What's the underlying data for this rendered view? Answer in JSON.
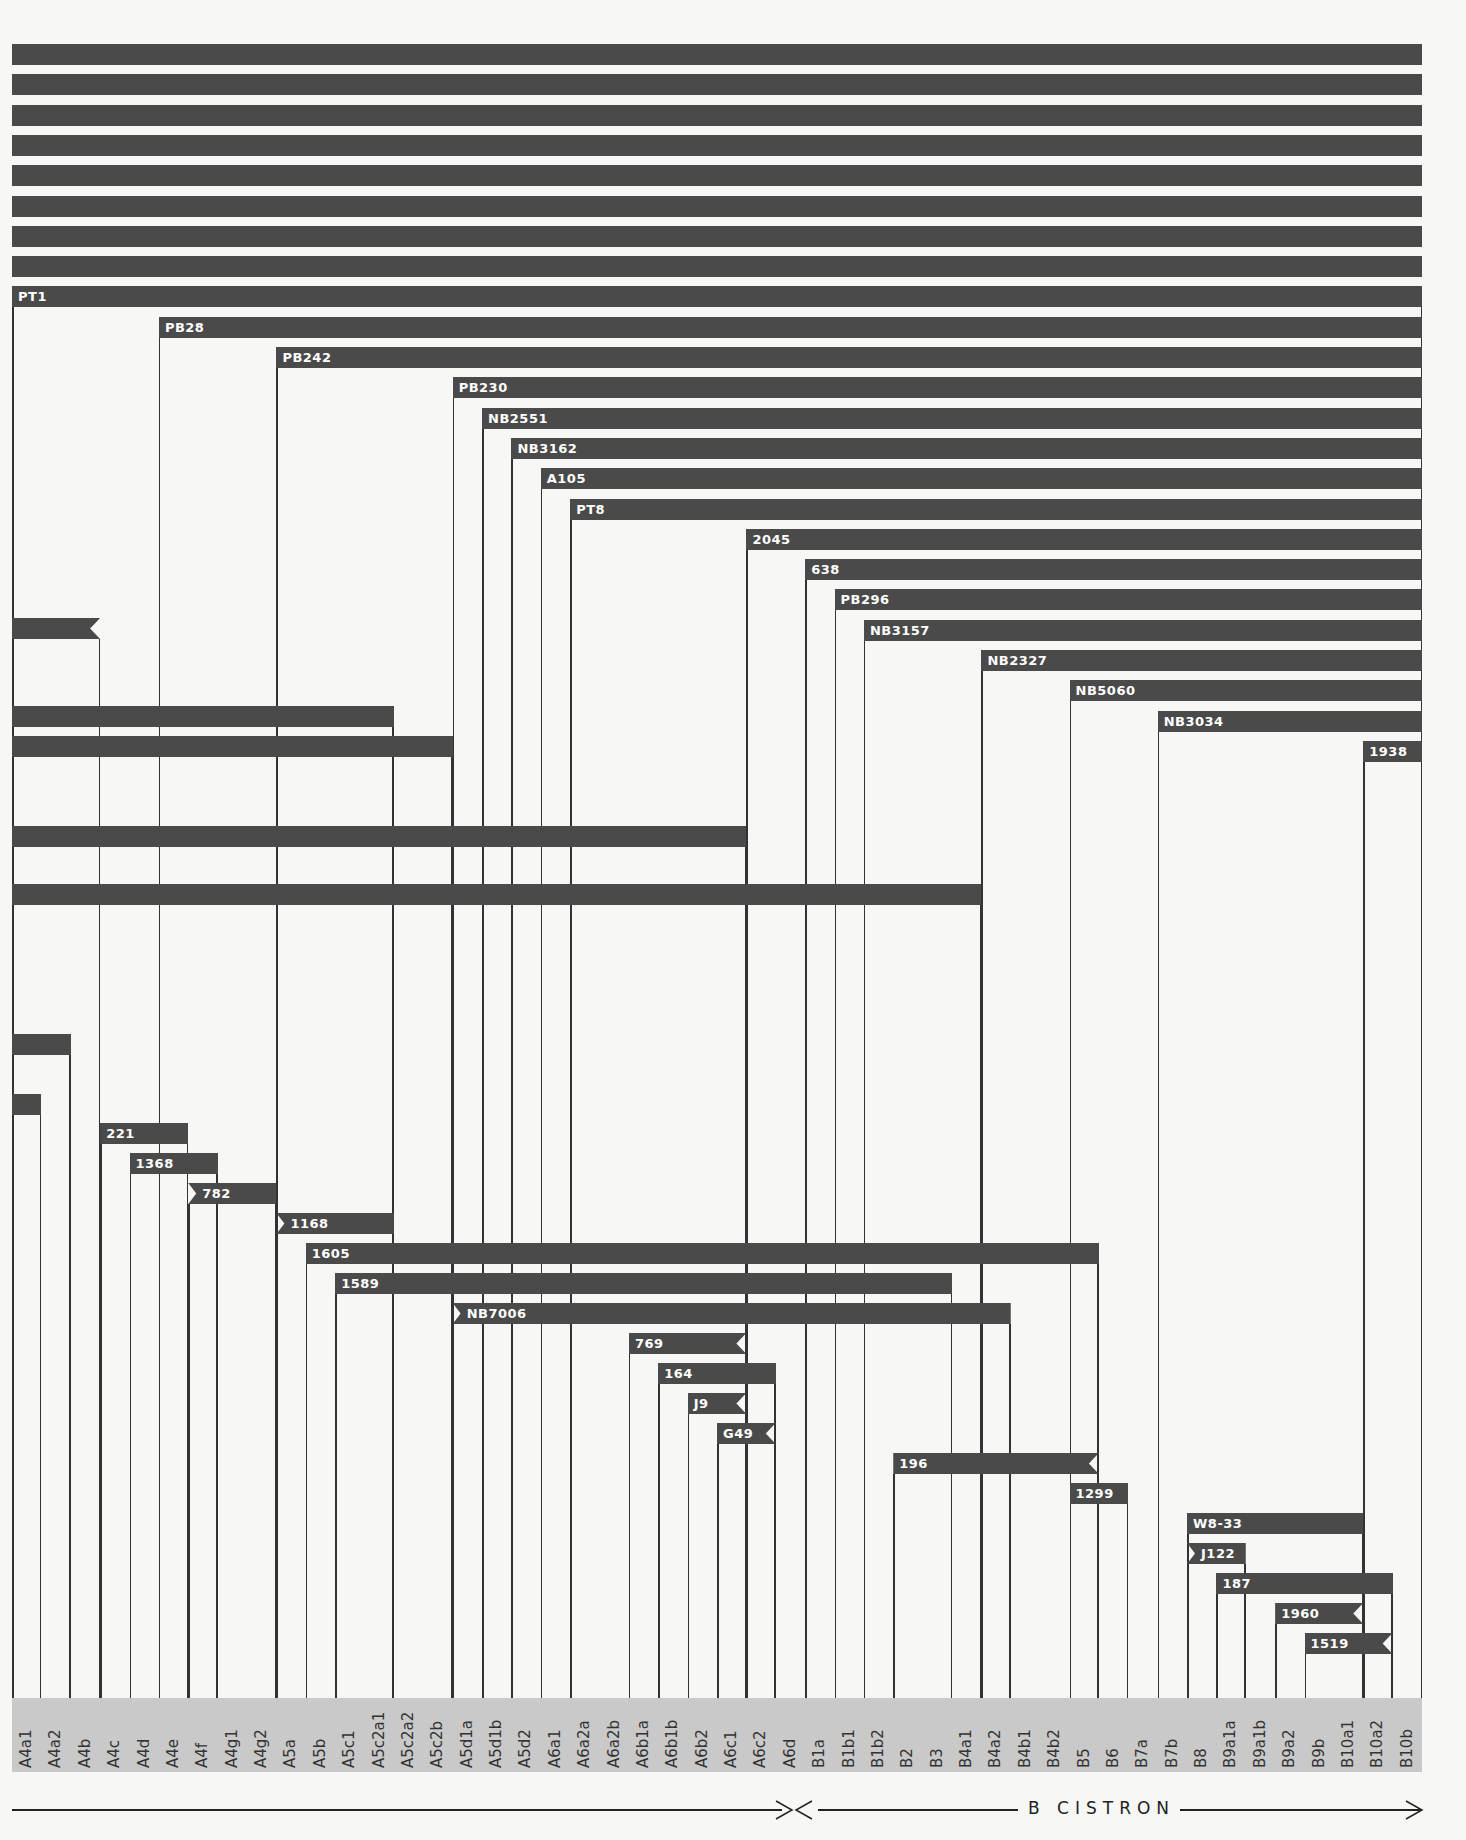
{
  "chart_data": {
    "type": "deletion-map",
    "title": "",
    "xlabel": "B CISTRON",
    "axis_annotation": "A cistron (left, arrow to A6d) | B cistron (B1a to B10b)",
    "columns": [
      "A4a1",
      "A4a2",
      "A4b",
      "A4c",
      "A4d",
      "A4e",
      "A4f",
      "A4g1",
      "A4g2",
      "A5a",
      "A5b",
      "A5c1",
      "A5c2a1",
      "A5c2a2",
      "A5c2b",
      "A5d1a",
      "A5d1b",
      "A5d2",
      "A6a1",
      "A6a2a",
      "A6a2b",
      "A6b1a",
      "A6b1b",
      "A6b2",
      "A6c1",
      "A6c2",
      "A6d",
      "B1a",
      "B1b1",
      "B1b2",
      "B2",
      "B3",
      "B4a1",
      "B4a2",
      "B4b1",
      "B4b2",
      "B5",
      "B6",
      "B7a",
      "B7b",
      "B8",
      "B9a1a",
      "B9a1b",
      "B9a2",
      "B9b",
      "B10a1",
      "B10a2",
      "B10b"
    ],
    "deletions": [
      {
        "label": "",
        "row": 0,
        "start": "A4a1",
        "end": "B10b",
        "style": "full"
      },
      {
        "label": "",
        "row": 1,
        "start": "A4a1",
        "end": "B10b",
        "style": "full"
      },
      {
        "label": "",
        "row": 2,
        "start": "A4a1",
        "end": "B10b",
        "style": "full"
      },
      {
        "label": "",
        "row": 3,
        "start": "A4a1",
        "end": "B10b",
        "style": "full"
      },
      {
        "label": "",
        "row": 4,
        "start": "A4a1",
        "end": "B10b",
        "style": "full"
      },
      {
        "label": "",
        "row": 5,
        "start": "A4a1",
        "end": "B10b",
        "style": "full"
      },
      {
        "label": "",
        "row": 6,
        "start": "A4a1",
        "end": "B10b",
        "style": "full"
      },
      {
        "label": "",
        "row": 7,
        "start": "A4a1",
        "end": "B10b",
        "style": "full"
      },
      {
        "label": "PT1",
        "row": 8,
        "start": "A4a1",
        "end": "B10b"
      },
      {
        "label": "PB28",
        "row": 9,
        "start": "A4e",
        "end": "B10b"
      },
      {
        "label": "PB242",
        "row": 10,
        "start": "A5a",
        "end": "B10b"
      },
      {
        "label": "PB230",
        "row": 11,
        "start": "A5d1a",
        "end": "B10b"
      },
      {
        "label": "NB2551",
        "row": 12,
        "start": "A5d1b",
        "end": "B10b"
      },
      {
        "label": "NB3162",
        "row": 13,
        "start": "A5d2",
        "end": "B10b"
      },
      {
        "label": "A105",
        "row": 14,
        "start": "A6a1",
        "end": "B10b"
      },
      {
        "label": "PT8",
        "row": 15,
        "start": "A6a2a",
        "end": "B10b"
      },
      {
        "label": "2045",
        "row": 16,
        "start": "A6c2",
        "end": "B10b"
      },
      {
        "label": "638",
        "row": 17,
        "start": "B1a",
        "end": "B10b"
      },
      {
        "label": "PB296",
        "row": 18,
        "start": "B1b1",
        "end": "B10b"
      },
      {
        "label": "NB3157",
        "row": 19,
        "start": "B1b2",
        "end": "B10b"
      },
      {
        "label": "NB2327",
        "row": 20,
        "start": "B4a2",
        "end": "B10b"
      },
      {
        "label": "NB5060",
        "row": 21,
        "start": "B5",
        "end": "B10b"
      },
      {
        "label": "NB3034",
        "row": 22,
        "start": "B7b",
        "end": "B10b"
      },
      {
        "label": "1938",
        "row": 23,
        "start": "B10a2",
        "end": "B10b"
      },
      {
        "label": "",
        "row": "u1",
        "start": "A4a1",
        "end": "A4b",
        "style": "notch-right"
      },
      {
        "label": "",
        "row": "u2",
        "start": "A4a1",
        "end": "A5c2a1"
      },
      {
        "label": "",
        "row": "u3",
        "start": "A4a1",
        "end": "A5c2b"
      },
      {
        "label": "",
        "row": "u4",
        "start": "A4a1",
        "end": "A6c1"
      },
      {
        "label": "",
        "row": "u5",
        "start": "A4a1",
        "end": "B4a1"
      },
      {
        "label": "",
        "row": "u6",
        "start": "A4a1",
        "end": "A4a2"
      },
      {
        "label": "",
        "row": "u7",
        "start": "A4a1",
        "end": "A4a1"
      },
      {
        "label": "221",
        "start": "A4c",
        "end": "A4e"
      },
      {
        "label": "1368",
        "start": "A4d",
        "end": "A4f"
      },
      {
        "label": "782",
        "start": "A4f",
        "end": "A4g2",
        "style": "notch-left"
      },
      {
        "label": "1168",
        "start": "A5a",
        "end": "A5c2a1",
        "style": "notch-left"
      },
      {
        "label": "1605",
        "start": "A5b",
        "end": "B5"
      },
      {
        "label": "1589",
        "start": "A5c1",
        "end": "B3"
      },
      {
        "label": "NB7006",
        "start": "A5d1a",
        "end": "B4a2",
        "style": "notch-left"
      },
      {
        "label": "769",
        "start": "A6b1a",
        "end": "A6c1",
        "style": "notch-right"
      },
      {
        "label": "164",
        "start": "A6b1b",
        "end": "A6c2"
      },
      {
        "label": "J9",
        "start": "A6b2",
        "end": "A6c1",
        "style": "notch-right"
      },
      {
        "label": "G49",
        "start": "A6c1",
        "end": "A6c2",
        "style": "notch-right"
      },
      {
        "label": "196",
        "start": "B2",
        "end": "B5",
        "style": "notch-right"
      },
      {
        "label": "1299",
        "start": "B5",
        "end": "B6"
      },
      {
        "label": "W8-33",
        "start": "B8",
        "end": "B10a1"
      },
      {
        "label": "J122",
        "start": "B8",
        "end": "B9a1a",
        "style": "notch-left"
      },
      {
        "label": "187",
        "start": "B9a1a",
        "end": "B10a2"
      },
      {
        "label": "1960",
        "start": "B9a2",
        "end": "B10a1",
        "style": "notch-right"
      },
      {
        "label": "1519",
        "start": "B9b",
        "end": "B10a2",
        "style": "notch-right"
      }
    ],
    "legend": [],
    "grid": false
  },
  "axis": {
    "b_label": "B CISTRON"
  },
  "colors": {
    "bar": "#4a4a4a",
    "band": "#c9c9c9",
    "background": "#f7f7f5",
    "line": "#333333"
  }
}
